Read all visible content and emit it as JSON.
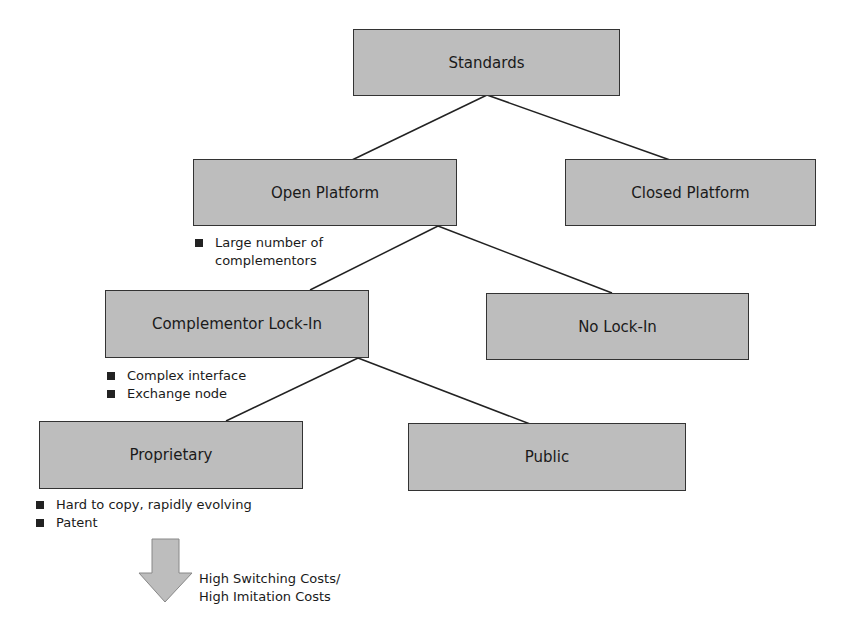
{
  "diagram": {
    "nodes": [
      {
        "id": "standards",
        "label": "Standards"
      },
      {
        "id": "open-platform",
        "label": "Open Platform"
      },
      {
        "id": "closed-platform",
        "label": "Closed Platform"
      },
      {
        "id": "complementor-lock-in",
        "label": "Complementor Lock-In"
      },
      {
        "id": "no-lock-in",
        "label": "No Lock-In"
      },
      {
        "id": "proprietary",
        "label": "Proprietary"
      },
      {
        "id": "public",
        "label": "Public"
      }
    ],
    "edges": [
      {
        "from": "standards",
        "to": "open-platform"
      },
      {
        "from": "standards",
        "to": "closed-platform"
      },
      {
        "from": "open-platform",
        "to": "complementor-lock-in"
      },
      {
        "from": "open-platform",
        "to": "no-lock-in"
      },
      {
        "from": "complementor-lock-in",
        "to": "proprietary"
      },
      {
        "from": "complementor-lock-in",
        "to": "public"
      }
    ],
    "open_platform_notes": [
      "Large number of complementors"
    ],
    "lock_in_notes": [
      "Complex interface",
      "Exchange node"
    ],
    "proprietary_notes": [
      "Hard to copy, rapidly evolving",
      "Patent"
    ],
    "outcome": {
      "line1": "High Switching Costs/",
      "line2": "High Imitation Costs"
    }
  }
}
